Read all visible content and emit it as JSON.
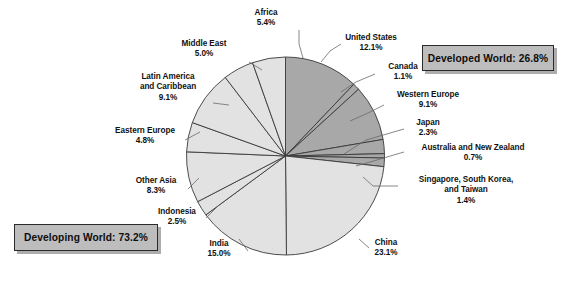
{
  "chart_data": {
    "type": "pie",
    "title": "",
    "unit": "percent",
    "start_angle_deg": 0,
    "direction": "clockwise",
    "categories": [
      "United States",
      "Canada",
      "Western Europe",
      "Japan",
      "Australia and New Zealand",
      "Singapore, South Korea, and Taiwan",
      "China",
      "India",
      "Indonesia",
      "Other Asia",
      "Eastern Europe",
      "Latin America and Caribbean",
      "Middle East",
      "Africa"
    ],
    "values": [
      12.1,
      1.1,
      9.1,
      2.3,
      0.7,
      1.4,
      23.1,
      15.0,
      2.5,
      8.3,
      4.8,
      9.1,
      5.0,
      5.4
    ],
    "groups": [
      {
        "name": "Developed World",
        "total": 26.8,
        "color": "#a8a8a8",
        "members": [
          "United States",
          "Canada",
          "Western Europe",
          "Japan",
          "Australia and New Zealand",
          "Singapore, South Korea, and Taiwan"
        ]
      },
      {
        "name": "Developing World",
        "total": 73.2,
        "color": "#e2e2e2",
        "members": [
          "China",
          "India",
          "Indonesia",
          "Other Asia",
          "Eastern Europe",
          "Latin America and Caribbean",
          "Middle East",
          "Africa"
        ]
      }
    ],
    "legend": "none",
    "grid": false
  },
  "colors": {
    "developed_fill": "#a8a8a8",
    "developing_fill": "#e2e2e2",
    "slice_stroke": "#3a3a3a",
    "callout_fill": "#bdbdbd",
    "callout_border": "#2b2b2b",
    "leader_line": "#6a6a6a",
    "text": "#111111",
    "background": "#ffffff"
  },
  "callouts": {
    "developed": "Developed World: 26.8%",
    "developing": "Developing World: 73.2%"
  },
  "slice_labels": [
    {
      "key": "africa",
      "name": "Africa",
      "pct": "5.4%"
    },
    {
      "key": "middle_east",
      "name": "Middle East",
      "pct": "5.0%"
    },
    {
      "key": "latin_america",
      "name": "Latin America",
      "name2": "and Caribbean",
      "pct": "9.1%"
    },
    {
      "key": "eastern_europe",
      "name": "Eastern Europe",
      "pct": "4.8%"
    },
    {
      "key": "other_asia",
      "name": "Other Asia",
      "pct": "8.3%"
    },
    {
      "key": "indonesia",
      "name": "Indonesia",
      "pct": "2.5%"
    },
    {
      "key": "india",
      "name": "India",
      "pct": "15.0%"
    },
    {
      "key": "china",
      "name": "China",
      "pct": "23.1%"
    },
    {
      "key": "singapore",
      "name": "Singapore, South Korea,",
      "name2": "and Taiwan",
      "pct": "1.4%"
    },
    {
      "key": "australia",
      "name": "Australia and New Zealand",
      "pct": "0.7%"
    },
    {
      "key": "japan",
      "name": "Japan",
      "pct": "2.3%"
    },
    {
      "key": "western_europe",
      "name": "Western Europe",
      "pct": "9.1%"
    },
    {
      "key": "canada",
      "name": "Canada",
      "pct": "1.1%"
    },
    {
      "key": "united_states",
      "name": "United States",
      "pct": "12.1%"
    }
  ]
}
